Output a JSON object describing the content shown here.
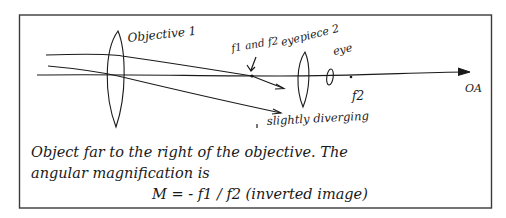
{
  "diagram": {
    "colors": {
      "ink": "#1a1a1a",
      "frame": "#3a3a3a",
      "background": "#ffffff"
    },
    "labels": {
      "objective": "Objective 1",
      "focal_point_label": "f1 and f2",
      "eyepiece": "eyepiece 2",
      "eye": "eye",
      "f2": "f2",
      "axis": "OA",
      "diverging": "slightly diverging"
    },
    "caption": {
      "line1": "Object far to the right of the objective. The",
      "line2": "angular magnification is",
      "line3": "M = - f1 / f2   (inverted image)"
    }
  }
}
